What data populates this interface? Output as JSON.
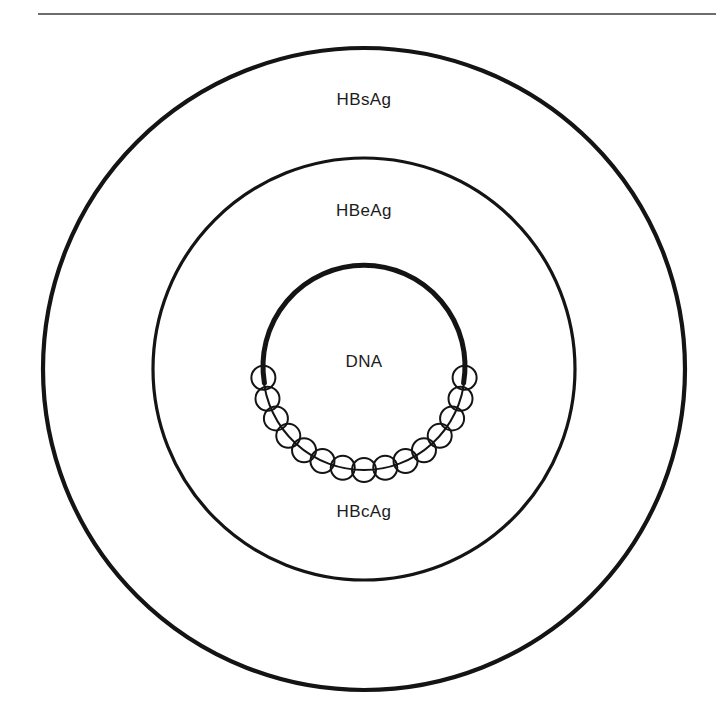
{
  "figure": {
    "background_color": "#ffffff",
    "ink_color": "#141414",
    "rule_color": "#3c3c3c",
    "label_color": "#1c1c1c",
    "width": 716,
    "height": 728
  },
  "top_rule": {
    "name": "horizontal-rule",
    "x1": 38,
    "x2": 716,
    "y": 14,
    "thickness": 1.6,
    "color": "#3c3c3c"
  },
  "geometry": {
    "center_x": 364,
    "center_y": 369,
    "outer_radius": 321,
    "middle_radius": 211,
    "inner_radius": 101,
    "outer_stroke": 4.2,
    "middle_stroke": 3.2,
    "inner_stroke": 5.0,
    "particle_radius": 12,
    "particle_stroke": 2.0,
    "particle_count": 15,
    "arc_start_deg": 5,
    "arc_sweep_deg": 170
  },
  "layers": [
    {
      "id": "outer",
      "name": "outer-envelope-circle",
      "label": "HBsAg",
      "description": "surface antigen envelope",
      "radius": 321,
      "stroke": 4.2,
      "label_x": 364,
      "label_y": 105
    },
    {
      "id": "middle",
      "name": "middle-envelope-circle",
      "label": "HBeAg",
      "description": "e antigen layer",
      "radius": 211,
      "stroke": 3.2,
      "label_x": 364,
      "label_y": 216
    },
    {
      "id": "inner",
      "name": "inner-core-arc",
      "label": "DNA",
      "description": "viral DNA core arc",
      "radius": 101,
      "stroke": 5.0,
      "label_x": 364,
      "label_y": 367
    },
    {
      "id": "capsid",
      "name": "capsid-particle-chain",
      "label": "HBcAg",
      "description": "core antigen capsid subunits",
      "radius": 101,
      "stroke": 2.0,
      "label_x": 364,
      "label_y": 517
    }
  ],
  "labels": {
    "surface_antigen": "HBsAg",
    "e_antigen": "HBeAg",
    "dna": "DNA",
    "core_antigen": "HBcAg"
  },
  "chart_data": {
    "type": "diagram",
    "concentric_rings": [
      {
        "name": "HBsAg",
        "radius": 321,
        "role": "outer surface antigen envelope"
      },
      {
        "name": "HBeAg",
        "radius": 211,
        "role": "e antigen layer"
      },
      {
        "name": "DNA",
        "radius": 101,
        "role": "viral genome core"
      }
    ],
    "particle_chain": {
      "name": "HBcAg",
      "count": 15,
      "particle_radius": 12,
      "on_radius": 101,
      "role": "core antigen capsid subunits arranged along lower core arc"
    },
    "annotations": [
      "HBsAg",
      "HBeAg",
      "DNA",
      "HBcAg"
    ]
  }
}
